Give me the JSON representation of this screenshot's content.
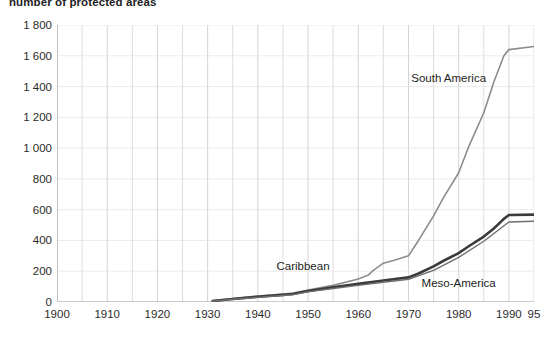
{
  "chart_data": {
    "type": "line",
    "title": "number of protected areas",
    "xlabel": "",
    "ylabel": "number of protected areas",
    "xlim": [
      1900,
      1995
    ],
    "ylim": [
      0,
      1800
    ],
    "ytick_values": [
      0,
      200,
      400,
      600,
      800,
      1000,
      1200,
      1400,
      1600,
      1800
    ],
    "ytick_labels": [
      "0",
      "200",
      "400",
      "600",
      "800",
      "1 000",
      "1 200",
      "1 400",
      "1 600",
      "1 800"
    ],
    "xtick_values": [
      1900,
      1910,
      1920,
      1930,
      1940,
      1950,
      1960,
      1970,
      1980,
      1990,
      1995
    ],
    "xtick_labels": [
      "1900",
      "1910",
      "1920",
      "1930",
      "1940",
      "1950",
      "1960",
      "1970",
      "1980",
      "1990",
      "95"
    ],
    "grid": "vertical gridlines every 5 years, faint horizontal gridlines at each y tick",
    "legend": "inline annotations next to curves",
    "series": [
      {
        "name": "South America",
        "color": "#8c8c8c",
        "width": 1.6,
        "label_x": 1978,
        "label_y": 1430,
        "points": [
          [
            1931,
            8
          ],
          [
            1935,
            22
          ],
          [
            1940,
            38
          ],
          [
            1945,
            52
          ],
          [
            1947,
            58
          ],
          [
            1950,
            78
          ],
          [
            1955,
            108
          ],
          [
            1960,
            150
          ],
          [
            1962,
            175
          ],
          [
            1963,
            205
          ],
          [
            1965,
            252
          ],
          [
            1967,
            270
          ],
          [
            1970,
            300
          ],
          [
            1972,
            400
          ],
          [
            1975,
            560
          ],
          [
            1977,
            680
          ],
          [
            1980,
            840
          ],
          [
            1982,
            1010
          ],
          [
            1985,
            1230
          ],
          [
            1987,
            1430
          ],
          [
            1989,
            1600
          ],
          [
            1990,
            1640
          ],
          [
            1995,
            1660
          ]
        ]
      },
      {
        "name": "Meso-America",
        "color": "#3b3b3b",
        "width": 2.6,
        "label_x": 1980,
        "label_y": 95,
        "points": [
          [
            1931,
            6
          ],
          [
            1935,
            20
          ],
          [
            1940,
            34
          ],
          [
            1945,
            46
          ],
          [
            1947,
            52
          ],
          [
            1950,
            72
          ],
          [
            1955,
            96
          ],
          [
            1960,
            118
          ],
          [
            1965,
            140
          ],
          [
            1970,
            160
          ],
          [
            1972,
            185
          ],
          [
            1975,
            232
          ],
          [
            1977,
            268
          ],
          [
            1980,
            318
          ],
          [
            1982,
            362
          ],
          [
            1985,
            425
          ],
          [
            1987,
            478
          ],
          [
            1989,
            540
          ],
          [
            1990,
            565
          ],
          [
            1995,
            568
          ]
        ]
      },
      {
        "name": "Caribbean",
        "color": "#6e6e6e",
        "width": 1.4,
        "label_x": 1949,
        "label_y": 205,
        "points": [
          [
            1931,
            5
          ],
          [
            1935,
            18
          ],
          [
            1940,
            30
          ],
          [
            1945,
            42
          ],
          [
            1947,
            48
          ],
          [
            1950,
            66
          ],
          [
            1955,
            88
          ],
          [
            1960,
            108
          ],
          [
            1965,
            128
          ],
          [
            1970,
            148
          ],
          [
            1975,
            205
          ],
          [
            1980,
            290
          ],
          [
            1985,
            395
          ],
          [
            1990,
            520
          ],
          [
            1995,
            525
          ]
        ]
      }
    ]
  }
}
